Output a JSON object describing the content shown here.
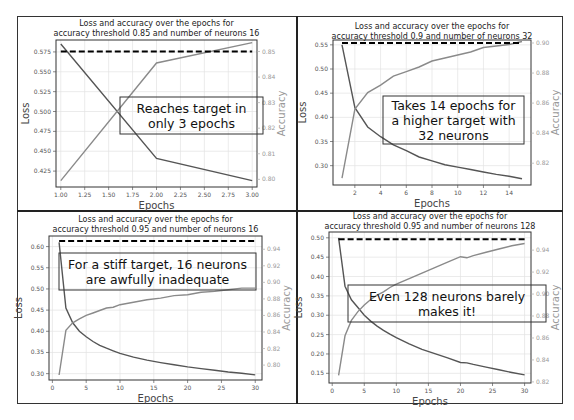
{
  "chart_data": [
    {
      "type": "line",
      "title": "Loss and accuracy over the epochs for accuracy threshold 0.85 and number of neurons 16",
      "title_lines": [
        "Loss and accuracy over the epochs for",
        "accuracy threshold 0.85 and number of neurons 16"
      ],
      "xlabel": "Epochs",
      "ylabel": "Loss",
      "ylabel_right": "Accuracy",
      "xlim": [
        0.95,
        3.05
      ],
      "ylim": [
        0.405,
        0.59
      ],
      "ylim_right": [
        0.797,
        0.8545
      ],
      "xticks": [
        1.0,
        1.25,
        1.5,
        1.75,
        2.0,
        2.25,
        2.5,
        2.75,
        3.0
      ],
      "xtick_labels": [
        "1.00",
        "1.25",
        "1.50",
        "1.75",
        "2.00",
        "2.25",
        "2.50",
        "2.75",
        "3.00"
      ],
      "yticks": [
        0.425,
        0.45,
        0.475,
        0.5,
        0.525,
        0.55,
        0.575
      ],
      "ytick_labels": [
        "0.425",
        "0.450",
        "0.475",
        "0.500",
        "0.525",
        "0.550",
        "0.575"
      ],
      "yticks_right": [
        0.8,
        0.81,
        0.82,
        0.83,
        0.84,
        0.85
      ],
      "ytick_labels_right": [
        "0.80",
        "0.81",
        "0.82",
        "0.83",
        "0.84",
        "0.85"
      ],
      "grid": true,
      "series": [
        {
          "name": "Loss",
          "axis": "left",
          "color": "#555555",
          "x": [
            1,
            2,
            3
          ],
          "values": [
            0.585,
            0.441,
            0.413
          ]
        },
        {
          "name": "Accuracy",
          "axis": "right",
          "color": "#8a8a8a",
          "x": [
            1,
            2,
            3
          ],
          "values": [
            0.7995,
            0.8455,
            0.8535
          ]
        }
      ],
      "threshold": {
        "axis": "right",
        "value": 0.85,
        "x_range": [
          1,
          3
        ],
        "style": "dashed",
        "color": "#000000"
      },
      "annotation": "Reaches target in only 3 epochs",
      "annotation_lines": [
        "Reaches target in",
        "only 3 epochs"
      ]
    },
    {
      "type": "line",
      "title": "Loss and accuracy over the epochs for accuracy threshold 0.9 and number of neurons 32",
      "title_lines": [
        "Loss and accuracy over the epochs for",
        "accuracy threshold 0.9 and number of neurons 32"
      ],
      "xlabel": "Epochs",
      "ylabel": "Loss",
      "ylabel_right": "Accuracy",
      "xlim": [
        0.3,
        15.7
      ],
      "ylim": [
        0.26,
        0.56
      ],
      "ylim_right": [
        0.8055,
        0.902
      ],
      "xticks": [
        2,
        4,
        6,
        8,
        10,
        12,
        14
      ],
      "xtick_labels": [
        "2",
        "4",
        "6",
        "8",
        "10",
        "12",
        "14"
      ],
      "yticks": [
        0.3,
        0.35,
        0.4,
        0.45,
        0.5,
        0.55
      ],
      "ytick_labels": [
        "0.30",
        "0.35",
        "0.40",
        "0.45",
        "0.50",
        "0.55"
      ],
      "yticks_right": [
        0.82,
        0.84,
        0.86,
        0.88,
        0.9
      ],
      "ytick_labels_right": [
        "0.82",
        "0.84",
        "0.86",
        "0.88",
        "0.90"
      ],
      "grid": true,
      "series": [
        {
          "name": "Loss",
          "axis": "left",
          "color": "#555555",
          "x": [
            1,
            2,
            3,
            4,
            5,
            6,
            7,
            8,
            9,
            10,
            11,
            12,
            13,
            14,
            15
          ],
          "values": [
            0.55,
            0.42,
            0.38,
            0.36,
            0.343,
            0.331,
            0.318,
            0.31,
            0.302,
            0.297,
            0.292,
            0.287,
            0.282,
            0.278,
            0.273
          ]
        },
        {
          "name": "Accuracy",
          "axis": "right",
          "color": "#8a8a8a",
          "x": [
            1,
            2,
            3,
            4,
            5,
            6,
            7,
            8,
            9,
            10,
            11,
            12,
            13,
            14,
            15
          ],
          "values": [
            0.81,
            0.856,
            0.867,
            0.872,
            0.878,
            0.881,
            0.884,
            0.888,
            0.89,
            0.892,
            0.894,
            0.897,
            0.898,
            0.899,
            0.901
          ]
        }
      ],
      "threshold": {
        "axis": "right",
        "value": 0.9,
        "x_range": [
          1,
          15
        ],
        "style": "dashed",
        "color": "#000000"
      },
      "annotation": "Takes 14 epochs for a higher target with 32 neurons",
      "annotation_lines": [
        "Takes 14 epochs for",
        "a higher target with",
        "32 neurons"
      ]
    },
    {
      "type": "line",
      "title": "Loss and accuracy over the epochs for accuracy threshold 0.95 and number of neurons 16",
      "title_lines": [
        "Loss and accuracy over the epochs for",
        "accuracy threshold 0.95 and number of neurons 16"
      ],
      "xlabel": "Epochs",
      "ylabel": "Loss",
      "ylabel_right": "Accuracy",
      "xlim": [
        -0.5,
        31.0
      ],
      "ylim": [
        0.285,
        0.625
      ],
      "ylim_right": [
        0.782,
        0.956
      ],
      "xticks": [
        0,
        5,
        10,
        15,
        20,
        25,
        30
      ],
      "xtick_labels": [
        "0",
        "5",
        "10",
        "15",
        "20",
        "25",
        "30"
      ],
      "yticks": [
        0.3,
        0.35,
        0.4,
        0.45,
        0.5,
        0.55,
        0.6
      ],
      "ytick_labels": [
        "0.30",
        "0.35",
        "0.40",
        "0.45",
        "0.50",
        "0.55",
        "0.60"
      ],
      "yticks_right": [
        0.8,
        0.82,
        0.84,
        0.86,
        0.88,
        0.9,
        0.92,
        0.94
      ],
      "ytick_labels_right": [
        "0.80",
        "0.82",
        "0.84",
        "0.86",
        "0.88",
        "0.90",
        "0.92",
        "0.94"
      ],
      "grid": true,
      "series": [
        {
          "name": "Loss",
          "axis": "left",
          "color": "#555555",
          "x": [
            1,
            2,
            3,
            4,
            5,
            6,
            7,
            8,
            9,
            10,
            12,
            14,
            16,
            18,
            20,
            22,
            24,
            26,
            28,
            30
          ],
          "values": [
            0.61,
            0.455,
            0.42,
            0.4,
            0.387,
            0.376,
            0.367,
            0.36,
            0.354,
            0.348,
            0.339,
            0.332,
            0.326,
            0.321,
            0.316,
            0.312,
            0.308,
            0.304,
            0.301,
            0.297
          ]
        },
        {
          "name": "Accuracy",
          "axis": "right",
          "color": "#8a8a8a",
          "x": [
            1,
            2,
            3,
            4,
            5,
            6,
            7,
            8,
            9,
            10,
            12,
            14,
            16,
            18,
            20,
            22,
            24,
            26,
            28,
            30
          ],
          "values": [
            0.788,
            0.842,
            0.851,
            0.856,
            0.86,
            0.863,
            0.866,
            0.869,
            0.87,
            0.873,
            0.876,
            0.879,
            0.881,
            0.884,
            0.885,
            0.888,
            0.889,
            0.891,
            0.893,
            0.893
          ]
        }
      ],
      "threshold": {
        "axis": "right",
        "value": 0.95,
        "x_range": [
          1,
          30
        ],
        "style": "dashed",
        "color": "#000000"
      },
      "annotation": "For a stiff target, 16 neurons are awfully inadequate",
      "annotation_lines": [
        "For a stiff target, 16 neurons",
        "are awfully inadequate"
      ]
    },
    {
      "type": "line",
      "title": "Loss and accuracy over the epochs for accuracy threshold 0.95 and number of neurons 128",
      "title_lines": [
        "Loss and accuracy over the epochs for",
        "accuracy threshold 0.95 and number of neurons 128"
      ],
      "xlabel": "Epochs",
      "ylabel": "Loss",
      "ylabel_right": "Accuracy",
      "xlim": [
        -0.5,
        31.0
      ],
      "ylim": [
        0.125,
        0.515
      ],
      "ylim_right": [
        0.819,
        0.9565
      ],
      "xticks": [
        0,
        5,
        10,
        15,
        20,
        25,
        30
      ],
      "xtick_labels": [
        "0",
        "5",
        "10",
        "15",
        "20",
        "25",
        "30"
      ],
      "yticks": [
        0.15,
        0.2,
        0.25,
        0.3,
        0.35,
        0.4,
        0.45,
        0.5
      ],
      "ytick_labels": [
        "0.15",
        "0.20",
        "0.25",
        "0.30",
        "0.35",
        "0.40",
        "0.45",
        "0.50"
      ],
      "yticks_right": [
        0.82,
        0.84,
        0.86,
        0.88,
        0.9,
        0.92,
        0.94
      ],
      "ytick_labels_right": [
        "0.82",
        "0.84",
        "0.86",
        "0.88",
        "0.90",
        "0.92",
        "0.94"
      ],
      "grid": true,
      "series": [
        {
          "name": "Loss",
          "axis": "left",
          "color": "#555555",
          "x": [
            1,
            2,
            3,
            4,
            5,
            6,
            7,
            8,
            9,
            10,
            12,
            14,
            16,
            18,
            20,
            21,
            22,
            24,
            26,
            28,
            30
          ],
          "values": [
            0.5,
            0.375,
            0.34,
            0.32,
            0.3,
            0.285,
            0.272,
            0.261,
            0.251,
            0.242,
            0.226,
            0.212,
            0.201,
            0.19,
            0.178,
            0.177,
            0.173,
            0.166,
            0.159,
            0.152,
            0.146
          ]
        },
        {
          "name": "Accuracy",
          "axis": "right",
          "color": "#8a8a8a",
          "x": [
            1,
            2,
            3,
            4,
            5,
            6,
            7,
            8,
            9,
            10,
            12,
            14,
            16,
            18,
            20,
            21,
            22,
            24,
            26,
            28,
            30
          ],
          "values": [
            0.826,
            0.862,
            0.876,
            0.884,
            0.89,
            0.895,
            0.899,
            0.902,
            0.906,
            0.909,
            0.914,
            0.919,
            0.924,
            0.929,
            0.934,
            0.933,
            0.935,
            0.938,
            0.941,
            0.944,
            0.946
          ]
        }
      ],
      "threshold": {
        "axis": "right",
        "value": 0.95,
        "x_range": [
          1,
          30
        ],
        "style": "dashed",
        "color": "#000000"
      },
      "annotation": "Even 128 neurons barely makes it!",
      "annotation_lines": [
        "Even 128 neurons barely",
        "makes it!"
      ]
    }
  ]
}
